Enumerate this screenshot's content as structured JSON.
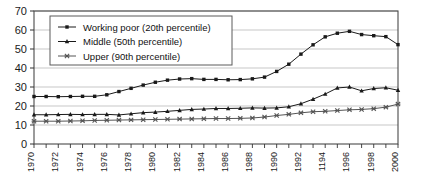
{
  "chart_data": {
    "type": "line",
    "title": "",
    "xlabel": "",
    "ylabel": "",
    "ylim": [
      0,
      70
    ],
    "ytick_step": 10,
    "yticks": [
      0,
      10,
      20,
      30,
      40,
      50,
      60,
      70
    ],
    "grid": "horizontal",
    "legend_position": "top-left-inside",
    "x": [
      1970,
      1971,
      1972,
      1973,
      1974,
      1975,
      1976,
      1977,
      1978,
      1979,
      1980,
      1981,
      1982,
      1983,
      1984,
      1985,
      1986,
      1987,
      1988,
      1989,
      1990,
      1991,
      1992,
      1993,
      1994,
      1995,
      1996,
      1997,
      1998,
      1999,
      2000
    ],
    "xtick_labels": [
      "1970",
      "1972",
      "1974",
      "1976",
      "1978",
      "1980",
      "1982",
      "1984",
      "1986",
      "1988",
      "1990",
      "1992",
      "1194",
      "1996",
      "1998",
      "2000"
    ],
    "xtick_values": [
      1970,
      1972,
      1974,
      1976,
      1978,
      1980,
      1982,
      1984,
      1986,
      1988,
      1990,
      1992,
      1994,
      1996,
      1998,
      2000
    ],
    "series": [
      {
        "name": "Working poor (20th percentile)",
        "marker": "square",
        "color": "#1a1a1a",
        "values": [
          25.0,
          25.0,
          24.9,
          25.0,
          25.1,
          25.1,
          25.9,
          27.6,
          29.3,
          31.0,
          32.5,
          33.6,
          34.2,
          34.4,
          34.0,
          34.0,
          33.8,
          33.9,
          34.3,
          35.2,
          38.2,
          42.0,
          47.3,
          52.2,
          56.4,
          58.3,
          59.3,
          57.6,
          57.0,
          56.5,
          52.3
        ]
      },
      {
        "name": "Middle (50th percentile)",
        "marker": "triangle",
        "color": "#1a1a1a",
        "values": [
          15.4,
          15.4,
          15.5,
          15.6,
          15.5,
          15.6,
          15.6,
          15.3,
          15.9,
          16.5,
          16.8,
          17.2,
          17.7,
          18.2,
          18.4,
          18.7,
          18.7,
          18.8,
          19.0,
          18.9,
          19.0,
          19.6,
          21.2,
          23.6,
          26.3,
          29.5,
          30.0,
          28.0,
          29.2,
          29.6,
          28.3
        ]
      },
      {
        "name": "Upper (90th percentile)",
        "marker": "x",
        "color": "#555555",
        "values": [
          12.0,
          12.0,
          12.0,
          12.1,
          12.2,
          12.4,
          12.5,
          12.6,
          12.7,
          12.8,
          12.9,
          13.0,
          13.1,
          13.2,
          13.3,
          13.4,
          13.4,
          13.5,
          13.7,
          14.2,
          15.0,
          15.6,
          16.4,
          17.0,
          17.2,
          17.6,
          18.0,
          18.2,
          18.6,
          19.4,
          21.0
        ]
      }
    ]
  }
}
